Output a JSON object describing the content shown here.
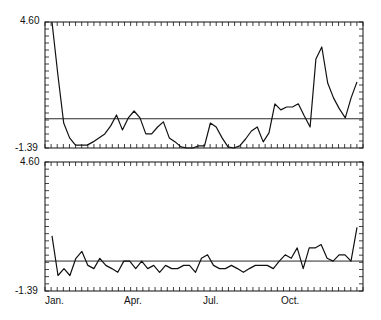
{
  "chart_data": [
    {
      "type": "line",
      "panel": "top",
      "title": "",
      "xlabel": "",
      "ylabel": "",
      "ylim": [
        -1.39,
        4.6
      ],
      "ytick_labels": [
        "4.60",
        "-1.39"
      ],
      "xtick_labels": [],
      "reference_line": 0,
      "grid": false,
      "x": [
        1,
        2,
        3,
        4,
        5,
        6,
        7,
        8,
        9,
        10,
        11,
        12,
        13,
        14,
        15,
        16,
        17,
        18,
        19,
        20,
        21,
        22,
        23,
        24,
        25,
        26,
        27,
        28,
        29,
        30,
        31,
        32,
        33,
        34,
        35,
        36,
        37,
        38,
        39,
        40,
        41,
        42,
        43,
        44,
        45,
        46,
        47,
        48,
        49,
        50,
        51,
        52
      ],
      "values": [
        4.6,
        2.08,
        -0.2,
        -0.91,
        -1.25,
        -1.25,
        -1.25,
        -1.1,
        -0.91,
        -0.72,
        -0.34,
        0.18,
        -0.53,
        0.04,
        0.37,
        0.04,
        -0.72,
        -0.72,
        -0.39,
        -0.15,
        -0.91,
        -1.1,
        -1.34,
        -1.39,
        -1.39,
        -1.29,
        -1.29,
        -0.2,
        -0.39,
        -0.91,
        -1.34,
        -1.39,
        -1.29,
        -0.96,
        -0.58,
        -0.39,
        -1.1,
        -0.67,
        0.71,
        0.42,
        0.56,
        0.56,
        0.71,
        0.14,
        -0.39,
        2.84,
        3.41,
        1.7,
        0.99,
        0.47,
        0.04,
        0.99,
        1.75
      ]
    },
    {
      "type": "line",
      "panel": "bottom",
      "title": "",
      "xlabel": "",
      "ylabel": "",
      "ylim": [
        -1.39,
        4.6
      ],
      "ytick_labels": [
        "4.60",
        "-1.39"
      ],
      "xtick_labels": [
        "Jan.",
        "Apr.",
        "Jul.",
        "Oct."
      ],
      "reference_line": 0,
      "grid": false,
      "x": [
        1,
        2,
        3,
        4,
        5,
        6,
        7,
        8,
        9,
        10,
        11,
        12,
        13,
        14,
        15,
        16,
        17,
        18,
        19,
        20,
        21,
        22,
        23,
        24,
        25,
        26,
        27,
        28,
        29,
        30,
        31,
        32,
        33,
        34,
        35,
        36,
        37,
        38,
        39,
        40,
        41,
        42,
        43,
        44,
        45,
        46,
        47,
        48,
        49,
        50,
        51,
        52
      ],
      "values": [
        1.17,
        -0.67,
        -0.35,
        -0.67,
        0.13,
        0.45,
        -0.2,
        -0.35,
        0.13,
        -0.2,
        -0.35,
        -0.52,
        0.0,
        0.0,
        -0.35,
        0.0,
        -0.35,
        -0.2,
        -0.52,
        -0.2,
        -0.35,
        -0.35,
        -0.2,
        -0.2,
        -0.52,
        0.13,
        0.29,
        -0.2,
        -0.35,
        -0.35,
        -0.2,
        -0.35,
        -0.52,
        -0.35,
        -0.2,
        -0.2,
        -0.2,
        -0.35,
        0.0,
        0.29,
        0.13,
        0.61,
        -0.35,
        0.61,
        0.61,
        0.77,
        0.13,
        0.0,
        0.29,
        0.29,
        0.0,
        1.57
      ]
    }
  ],
  "axes": {
    "y_max_label": "4.60",
    "y_min_label": "-1.39",
    "month_labels": [
      "Jan.",
      "Apr.",
      "Jul.",
      "Oct."
    ]
  }
}
